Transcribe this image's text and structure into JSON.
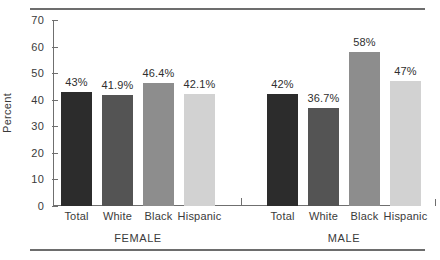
{
  "chart_data": {
    "type": "bar",
    "title": "",
    "xlabel": "",
    "ylabel": "Percent",
    "ylim": [
      0,
      70
    ],
    "yticks": [
      0,
      10,
      20,
      30,
      40,
      50,
      60,
      70
    ],
    "grid": false,
    "legend": "none",
    "groups": [
      {
        "name": "FEMALE",
        "categories": [
          "Total",
          "White",
          "Black",
          "Hispanic"
        ],
        "values": [
          43,
          41.9,
          46.4,
          42.1
        ],
        "labels": [
          "43%",
          "41.9%",
          "46.4%",
          "42.1%"
        ]
      },
      {
        "name": "MALE",
        "categories": [
          "Total",
          "White",
          "Black",
          "Hispanic"
        ],
        "values": [
          42,
          36.7,
          58,
          47
        ],
        "labels": [
          "42%",
          "36.7%",
          "58%",
          "47%"
        ]
      }
    ],
    "series_colors": {
      "Total": "#2c2c2c",
      "White": "#545454",
      "Black": "#8d8d8d",
      "Hispanic": "#d2d2d2"
    }
  },
  "axis": {
    "y_tick_labels": [
      "0",
      "10",
      "20",
      "30",
      "40",
      "50",
      "60",
      "70"
    ],
    "y_title": "Percent"
  },
  "bars": [
    {
      "label": "43%",
      "category": "Total",
      "group": "FEMALE",
      "value": 43,
      "color": "#2c2c2c"
    },
    {
      "label": "41.9%",
      "category": "White",
      "group": "FEMALE",
      "value": 41.9,
      "color": "#545454"
    },
    {
      "label": "46.4%",
      "category": "Black",
      "group": "FEMALE",
      "value": 46.4,
      "color": "#8d8d8d"
    },
    {
      "label": "42.1%",
      "category": "Hispanic",
      "group": "FEMALE",
      "value": 42.1,
      "color": "#d2d2d2"
    },
    {
      "label": "42%",
      "category": "Total",
      "group": "MALE",
      "value": 42,
      "color": "#2c2c2c"
    },
    {
      "label": "36.7%",
      "category": "White",
      "group": "MALE",
      "value": 36.7,
      "color": "#545454"
    },
    {
      "label": "58%",
      "category": "Black",
      "group": "MALE",
      "value": 58,
      "color": "#8d8d8d"
    },
    {
      "label": "47%",
      "category": "Hispanic",
      "group": "MALE",
      "value": 47,
      "color": "#d2d2d2"
    }
  ],
  "group_labels": [
    "FEMALE",
    "MALE"
  ]
}
